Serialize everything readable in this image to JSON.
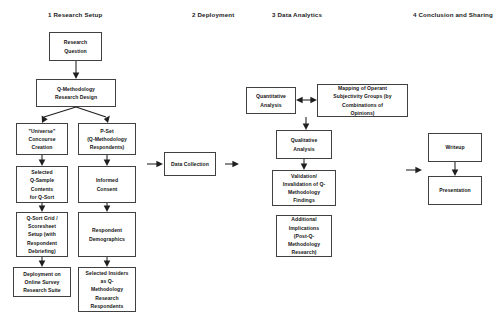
{
  "diagram": {
    "background_color": "#ffffff",
    "box_border_color": "#404040",
    "arrow_color": "#1f1f1f",
    "text_color": "#141414"
  },
  "phases": [
    {
      "id": "phase-1",
      "label": "1  Research Setup"
    },
    {
      "id": "phase-2",
      "label": "2  Deployment"
    },
    {
      "id": "phase-3",
      "label": "3  Data Analytics"
    },
    {
      "id": "phase-4",
      "label": "4  Conclusion and Sharing"
    }
  ],
  "nodes": {
    "research_question": "Research\nQuestion",
    "research_design": "Q-Methodology\nResearch Design",
    "universe_concourse": "\"Universe\"\nConcourse\nCreation",
    "p_set": "P-Set\n(Q-Methodology\nRespondents)",
    "q_sample": "Selected\nQ-Sample\nContents\nfor Q-Sort",
    "informed_consent": "Informed\nConsent",
    "q_sort_grid": "Q-Sort Grid /\nScoresheet\nSetup (with\nRespondent\nDebriefing)",
    "respondent_demographics": "Respondent\nDemographics",
    "deployment_online": "Deployment on\nOnline Survey\nResearch Suite",
    "selected_insiders": "Selected Insiders\nas Q-\nMethodology\nResearch\nRespondents",
    "data_collection": "Data Collection",
    "quantitative_analysis": "Quantitative\nAnalysis",
    "mapping_operant": "Mapping of Operant\nSubjectivity Groups (by\nCombinations of\nOpinions)",
    "qualitative_analysis": "Qualitative\nAnalysis",
    "validation": "Validation/\nInvalidation of Q-\nMethodology\nFindings",
    "additional_implications": "Additional\nImplications\n(Post-Q-\nMethodology\nResearch)",
    "writeup": "Writeup",
    "presentation": "Presentation"
  }
}
